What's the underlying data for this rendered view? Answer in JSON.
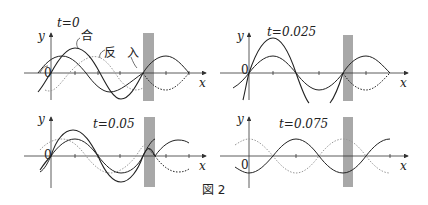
{
  "figure": {
    "caption": "図 2",
    "axis_labels": {
      "x": "x",
      "y": "y",
      "origin": "0"
    },
    "legend_labels": {
      "combined": "合",
      "reflected": "反",
      "incident": "入"
    },
    "colors": {
      "line": "#222222",
      "dotted": "#999999",
      "wall": "#a8a8a8",
      "axis": "#333333"
    },
    "panels": [
      {
        "id": "p1",
        "time_label": "t=0",
        "t": 0
      },
      {
        "id": "p2",
        "time_label": "t=0.025",
        "t": 0.025
      },
      {
        "id": "p3",
        "time_label": "t=0.05",
        "t": 0.05
      },
      {
        "id": "p4",
        "time_label": "t=0.075",
        "t": 0.075
      }
    ]
  }
}
